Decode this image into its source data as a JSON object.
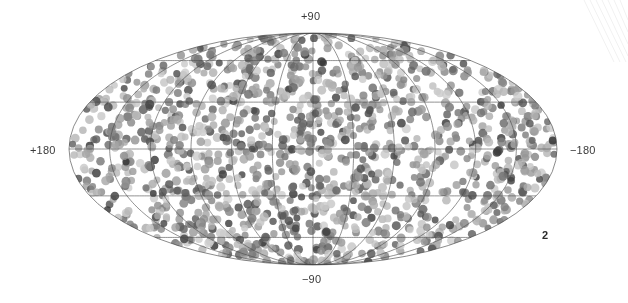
{
  "figure": {
    "number_label": "2",
    "projection": "mollweide",
    "background_color": "#ffffff"
  },
  "axes": {
    "north_pole_label": "+90",
    "south_pole_label": "−90",
    "left_label": "+180",
    "right_label": "−180"
  },
  "chart_data": {
    "type": "scatter",
    "title": "",
    "subtitle": "",
    "xlabel": "",
    "ylabel": "",
    "projection": "mollweide",
    "coordinate_system": "galactic",
    "grid": true,
    "legend": false,
    "legend_position": "none",
    "xlim": [
      180,
      -180
    ],
    "ylim": [
      -90,
      90
    ],
    "x_tick_labels": [
      "+180",
      "−180"
    ],
    "y_tick_labels": [
      "+90",
      "−90"
    ],
    "graticule": {
      "parallels_deg": [
        -60,
        -30,
        0,
        30,
        60
      ],
      "meridians_deg": [
        -150,
        -120,
        -90,
        -60,
        -30,
        0,
        30,
        60,
        90,
        120,
        150
      ],
      "line_color": "#4a4a4a",
      "line_width": 0.6,
      "boundary_color": "#3c3c3c"
    },
    "marker": {
      "shape": "circle",
      "diameter_px": 8,
      "opacity": 0.82,
      "grayscale_min": "#2e2e2e",
      "grayscale_max": "#cfcfcf"
    },
    "point_count": 1400,
    "distribution": "uniform-random-on-sphere",
    "random_seed": 20240517,
    "ellipse": {
      "center_x": 313,
      "center_y": 149,
      "semi_axis_x": 244,
      "semi_axis_y": 116
    },
    "note": "Approximately 1400 sources distributed near-uniformly over the full sky, rendered as semi-transparent gray filled circles with a 30-degree graticule."
  },
  "artifacts": {
    "corner_scan_lines": 7,
    "corner_scan_color": "#f2f2f2"
  }
}
